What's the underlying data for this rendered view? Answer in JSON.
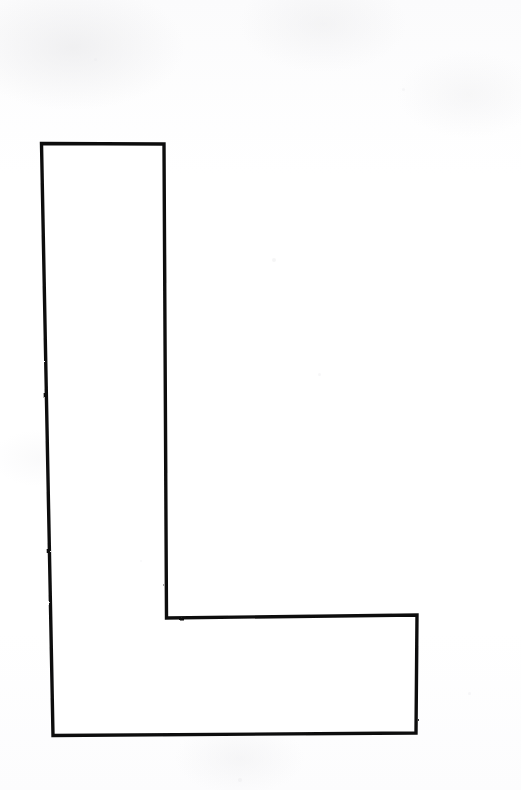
{
  "page": {
    "width": 521,
    "height": 790,
    "background_color": "#fdfdfd",
    "medium": "scanned line drawing"
  },
  "figure": {
    "name": "capital-letter-l-outline",
    "label": "L",
    "stroke_color": "#101010",
    "fill_color": "#ffffff",
    "stroke_width_px": 3.4,
    "bounding_box": {
      "x": 41,
      "y": 143,
      "width": 376,
      "height": 592
    },
    "vertices": [
      {
        "name": "top-left",
        "x": 41,
        "y": 143
      },
      {
        "name": "top-right",
        "x": 164,
        "y": 144
      },
      {
        "name": "stem-inner",
        "x": 167,
        "y": 618
      },
      {
        "name": "foot-top-right",
        "x": 417,
        "y": 615
      },
      {
        "name": "bottom-right",
        "x": 416,
        "y": 733
      },
      {
        "name": "bottom-left",
        "x": 53,
        "y": 735
      }
    ],
    "path_d": "M 41.5 143.5 L 164 144 L 166.5 618 L 417 615 L 416 733 L 53 735.5 Z",
    "segments": [
      {
        "name": "top-edge",
        "from": "top-left",
        "to": "top-right"
      },
      {
        "name": "stem-right-edge",
        "from": "top-right",
        "to": "stem-inner"
      },
      {
        "name": "foot-top-edge",
        "from": "stem-inner",
        "to": "foot-top-right"
      },
      {
        "name": "foot-right-edge",
        "from": "foot-top-right",
        "to": "bottom-right"
      },
      {
        "name": "bottom-edge",
        "from": "bottom-right",
        "to": "bottom-left"
      },
      {
        "name": "left-edge",
        "from": "bottom-left",
        "to": "top-left"
      }
    ]
  },
  "specks": [
    {
      "x": 272,
      "y": 258,
      "size": 4,
      "opacity": 0.5
    },
    {
      "x": 318,
      "y": 373,
      "size": 3,
      "opacity": 0.4
    },
    {
      "x": 238,
      "y": 778,
      "size": 4,
      "opacity": 0.45
    },
    {
      "x": 468,
      "y": 692,
      "size": 3,
      "opacity": 0.4
    },
    {
      "x": 94,
      "y": 58,
      "size": 3,
      "opacity": 0.35
    },
    {
      "x": 402,
      "y": 88,
      "size": 3,
      "opacity": 0.35
    },
    {
      "x": 140,
      "y": 560,
      "size": 2,
      "opacity": 0.35
    }
  ]
}
